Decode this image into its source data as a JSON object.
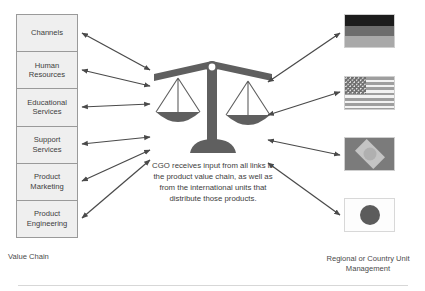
{
  "value_chain": {
    "label": "Value Chain",
    "items": [
      {
        "label": "Channels"
      },
      {
        "label": "Human Resources"
      },
      {
        "label": "Educational Services"
      },
      {
        "label": "Support Services"
      },
      {
        "label": "Product Marketing"
      },
      {
        "label": "Product Engineering"
      }
    ]
  },
  "center": {
    "icon": "balance-scale-icon",
    "text": "CGO receives input from all links in the product value chain, as well as from the international units that distribute those products."
  },
  "right": {
    "label": "Regional or Country Unit Management",
    "flags": [
      {
        "name": "germany-flag"
      },
      {
        "name": "united-states-flag"
      },
      {
        "name": "brazil-flag"
      },
      {
        "name": "japan-flag"
      }
    ]
  },
  "connectors": {
    "left_count": 6,
    "right_count": 4,
    "style": "double-headed-arrow"
  },
  "colors": {
    "box_fill": "#efefef",
    "box_border": "#9a9a9a",
    "scale_gray": "#5f5f5f",
    "arrow_gray": "#4a4a4a",
    "text": "#3d3d3d"
  }
}
